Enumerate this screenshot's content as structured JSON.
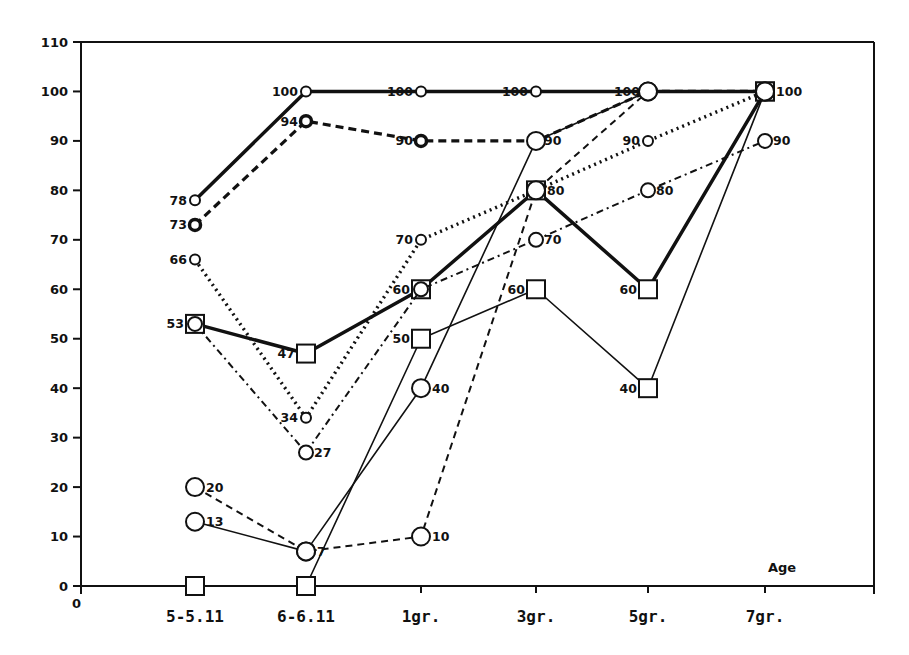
{
  "chart_data": {
    "type": "line",
    "title": "",
    "xlabel": "Age",
    "ylabel": "",
    "ylim": [
      0,
      110
    ],
    "yticks": [
      0,
      10,
      20,
      30,
      40,
      50,
      60,
      70,
      80,
      90,
      100,
      110
    ],
    "x_origin_label": "0",
    "grid": false,
    "legend": null,
    "categories": [
      "5-5.11",
      "6-6.11",
      "1gr.",
      "3gr.",
      "5gr.",
      "7gr."
    ],
    "series": [
      {
        "name": "series-1",
        "style": "solid-thick",
        "marker": "small-circle",
        "values": [
          78,
          100,
          100,
          100,
          100,
          100
        ],
        "labels": [
          "78",
          "100",
          "100",
          "100",
          "100",
          ""
        ]
      },
      {
        "name": "series-2",
        "style": "dashed-thick",
        "marker": "bold-circle",
        "values": [
          73,
          94,
          90,
          90,
          100,
          100
        ],
        "labels": [
          "73",
          "94",
          "90",
          "90",
          "",
          ""
        ]
      },
      {
        "name": "series-3",
        "style": "dotted-thick",
        "marker": "small-circle",
        "values": [
          66,
          34,
          70,
          80,
          90,
          100
        ],
        "labels": [
          "66",
          "34",
          "70",
          "",
          "90",
          ""
        ]
      },
      {
        "name": "series-4",
        "style": "solid-thick",
        "marker": "square",
        "values": [
          53,
          47,
          60,
          80,
          60,
          100
        ],
        "labels": [
          "53",
          "47",
          "60",
          "80",
          "60",
          "100"
        ]
      },
      {
        "name": "series-5",
        "style": "dash-dot",
        "marker": "circle",
        "values": [
          53,
          27,
          60,
          70,
          80,
          90
        ],
        "labels": [
          "",
          "27",
          "",
          "70",
          "80",
          "90"
        ]
      },
      {
        "name": "series-6",
        "style": "solid-thin",
        "marker": "square",
        "values": [
          0,
          0,
          50,
          60,
          40,
          100
        ],
        "labels": [
          "",
          "",
          "50",
          "60",
          "40",
          ""
        ]
      },
      {
        "name": "series-7",
        "style": "solid-thin",
        "marker": "large-circle",
        "values": [
          13,
          7,
          40,
          90,
          100,
          100
        ],
        "labels": [
          "13",
          "7",
          "40",
          "",
          "",
          ""
        ]
      },
      {
        "name": "series-8",
        "style": "dashed-thin",
        "marker": "large-circle",
        "values": [
          20,
          7,
          10,
          80,
          100,
          100
        ],
        "labels": [
          "20",
          "",
          "10",
          "",
          "",
          ""
        ]
      }
    ]
  }
}
